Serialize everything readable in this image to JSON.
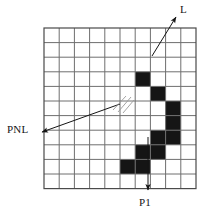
{
  "figure": {
    "background_color": "#ffffff",
    "ink_color": "#151515"
  },
  "grid": {
    "columns": 10,
    "rows": 11,
    "origin_x": 44,
    "origin_y": 28,
    "cell_width": 15.2,
    "cell_height": 14.6,
    "line_color": "#6e6e6e",
    "border_color": "#4a4a4a",
    "line_width": 1,
    "border_width": 1.2
  },
  "filled_cells": {
    "color": "#151515",
    "cells": [
      {
        "col": 6,
        "row": 3
      },
      {
        "col": 7,
        "row": 4
      },
      {
        "col": 8,
        "row": 5
      },
      {
        "col": 8,
        "row": 6
      },
      {
        "col": 7,
        "row": 7
      },
      {
        "col": 8,
        "row": 7
      },
      {
        "col": 7,
        "row": 8
      },
      {
        "col": 6,
        "row": 8
      },
      {
        "col": 5,
        "row": 9
      },
      {
        "col": 6,
        "row": 9
      }
    ]
  },
  "annotations": {
    "line_L": {
      "label": "L",
      "label_x": 180,
      "label_y": 13,
      "arrow_from_x": 152,
      "arrow_from_y": 56,
      "arrow_to_x": 176,
      "arrow_to_y": 17
    },
    "line_PNL": {
      "label": "PNL",
      "label_x": 7,
      "label_y": 133,
      "arrow_from_x": 120,
      "arrow_from_y": 104,
      "arrow_to_x": 42,
      "arrow_to_y": 132
    },
    "pointer_P1": {
      "label": "P1",
      "label_x": 139,
      "label_y": 206,
      "arrow_from_x": 148,
      "arrow_from_y": 137,
      "arrow_to_x": 148,
      "arrow_to_y": 190
    },
    "hatch_marks": {
      "name": "hatch-strokes",
      "count": 3,
      "x": 112,
      "y": 98
    }
  }
}
